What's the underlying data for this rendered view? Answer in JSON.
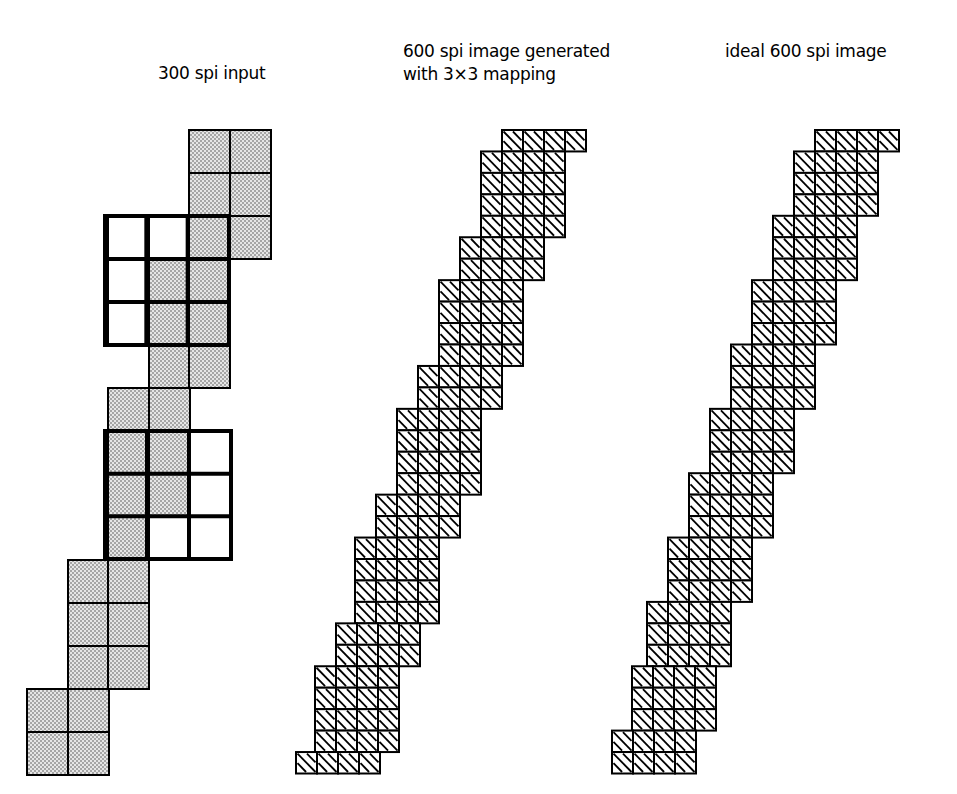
{
  "labels": {
    "left": "300 spi input",
    "middle_line1": "600 spi image generated",
    "middle_line2": "with 3×3 mapping",
    "right": "ideal 600 spi image"
  },
  "colors": {
    "ink": "#000000",
    "background": "#ffffff",
    "stipple_fill": "#c8c8c8",
    "empty_fill": "#ffffff"
  },
  "panels": {
    "input_300spi": {
      "cell": 41,
      "col_x": [
        27,
        68,
        108,
        149,
        189,
        230
      ],
      "row_y": [
        130,
        173,
        216,
        259,
        302,
        345,
        388,
        431,
        474,
        517,
        560,
        603,
        646,
        689,
        732
      ],
      "filled_cells": [
        [
          0,
          4
        ],
        [
          0,
          5
        ],
        [
          1,
          4
        ],
        [
          1,
          5
        ],
        [
          2,
          4
        ],
        [
          2,
          5
        ],
        [
          3,
          3
        ],
        [
          4,
          3
        ],
        [
          5,
          2
        ],
        [
          5,
          3
        ],
        [
          6,
          2
        ],
        [
          6,
          3
        ],
        [
          7,
          1
        ],
        [
          7,
          2
        ],
        [
          8,
          1
        ],
        [
          8,
          2
        ],
        [
          9,
          0
        ],
        [
          9,
          1
        ],
        [
          10,
          0
        ],
        [
          10,
          1
        ],
        [
          11,
          0
        ],
        [
          11,
          1
        ],
        [
          12,
          0
        ],
        [
          12,
          1
        ],
        [
          13,
          0
        ],
        [
          13,
          1
        ],
        [
          14,
          0
        ],
        [
          14,
          1
        ]
      ],
      "filled_cells_note": "row,col indices; row index maps to row_y",
      "stipple_cells": [
        [
          0,
          4
        ],
        [
          0,
          5
        ],
        [
          1,
          4
        ],
        [
          1,
          5
        ],
        [
          2,
          4
        ],
        [
          2,
          5
        ],
        [
          3,
          3
        ],
        [
          3,
          4
        ],
        [
          4,
          3
        ],
        [
          4,
          4
        ],
        [
          5,
          3
        ],
        [
          5,
          4
        ],
        [
          6,
          2
        ],
        [
          6,
          3
        ],
        [
          7,
          2
        ],
        [
          7,
          3
        ],
        [
          8,
          2
        ],
        [
          8,
          3
        ],
        [
          9,
          2
        ],
        [
          10,
          1
        ],
        [
          10,
          2
        ],
        [
          11,
          1
        ],
        [
          11,
          2
        ],
        [
          12,
          1
        ],
        [
          12,
          2
        ],
        [
          13,
          0
        ],
        [
          13,
          1
        ],
        [
          14,
          0
        ],
        [
          14,
          1
        ]
      ],
      "white_cells": [
        [
          2,
          2
        ],
        [
          2,
          3
        ],
        [
          3,
          2
        ],
        [
          4,
          2
        ],
        [
          7,
          4
        ],
        [
          8,
          4
        ],
        [
          9,
          3
        ],
        [
          9,
          4
        ]
      ],
      "bold_windows": [
        {
          "x": 105,
          "y": 216,
          "w": 124,
          "h": 129
        },
        {
          "x": 105,
          "y": 431,
          "w": 126,
          "h": 128
        }
      ]
    },
    "generated_600spi": {
      "cell": 21,
      "row_h": 21.45,
      "top": 130,
      "cols_per_row": 4,
      "row_left_x": [
        502,
        481,
        481,
        481,
        481,
        460,
        460,
        439,
        439,
        439,
        439,
        418,
        418,
        397,
        397,
        397,
        397,
        376,
        376,
        355,
        355,
        355,
        355,
        336,
        336,
        315,
        315,
        315,
        315,
        296
      ]
    },
    "ideal_600spi": {
      "cell": 21,
      "row_h": 21.45,
      "top": 130,
      "cols_per_row": 4,
      "row_left_x": [
        815,
        794,
        794,
        794,
        773,
        773,
        773,
        752,
        752,
        752,
        731,
        731,
        731,
        710,
        710,
        710,
        689,
        689,
        689,
        668,
        668,
        668,
        647,
        647,
        647,
        632,
        632,
        632,
        612,
        612
      ]
    }
  }
}
